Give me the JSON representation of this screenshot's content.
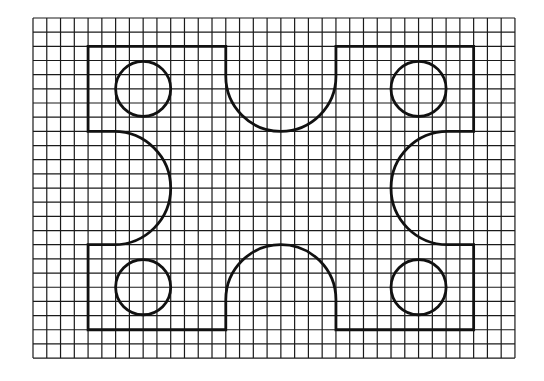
{
  "diagram": {
    "type": "grid-shape-drawing",
    "background_color": "#ffffff",
    "grid": {
      "origin_x": 33,
      "origin_y": 18,
      "columns": 35,
      "rows": 24,
      "cell_width": 13.77,
      "cell_height": 14.17,
      "line_color": "#1a1a1a",
      "line_width": 1.2
    },
    "shape": {
      "stroke_color": "#111111",
      "stroke_width": 2.8,
      "bounds_grid": {
        "left_col": 4,
        "right_col": 32,
        "top_row": 2,
        "bottom_row": 22
      },
      "notches": [
        {
          "name": "top-notch",
          "position": "top",
          "col_start": 14,
          "col_end": 22,
          "depth_rows": 6
        },
        {
          "name": "bottom-notch",
          "position": "bottom",
          "col_start": 14,
          "col_end": 22,
          "depth_rows": 6
        },
        {
          "name": "left-notch",
          "position": "left",
          "row_start": 8,
          "row_end": 16,
          "depth_cols": 6
        },
        {
          "name": "right-notch",
          "position": "right",
          "row_start": 8,
          "row_end": 16,
          "depth_cols": 6
        }
      ],
      "holes": [
        {
          "name": "top-left-hole",
          "center_col": 8,
          "center_row": 5,
          "radius_cols": 2
        },
        {
          "name": "top-right-hole",
          "center_col": 28,
          "center_row": 5,
          "radius_cols": 2
        },
        {
          "name": "bottom-left-hole",
          "center_col": 8,
          "center_row": 19,
          "radius_cols": 2
        },
        {
          "name": "bottom-right-hole",
          "center_col": 28,
          "center_row": 19,
          "radius_cols": 2
        }
      ]
    }
  }
}
